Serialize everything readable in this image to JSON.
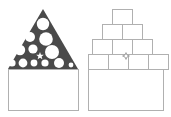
{
  "canvas": {
    "width": 171,
    "height": 117,
    "background": "#ffffff"
  },
  "palette": {
    "triangle_fill": "#4a4a4a",
    "circle_fill": "#ffffff",
    "star_fill": "#ffffff",
    "outline_stroke": "#b0b0b0",
    "box_fill": "#ffffff",
    "marker_stroke": "#9a9a9a"
  },
  "figures": [
    {
      "id": "left",
      "name": "filled-triangle-on-base",
      "description": "Dark triangle containing white circles of varying sizes above a plain rectangular base",
      "triangle": {
        "apex": [
          43,
          9
        ],
        "left_corner": [
          8,
          69
        ],
        "right_corner": [
          78,
          69
        ],
        "fill": "#4a4a4a"
      },
      "circles": [
        {
          "cx": 43,
          "cy": 24,
          "r": 6.2
        },
        {
          "cx": 30,
          "cy": 37,
          "r": 5.0
        },
        {
          "cx": 46,
          "cy": 39,
          "r": 6.8
        },
        {
          "cx": 20,
          "cy": 50,
          "r": 5.2
        },
        {
          "cx": 33,
          "cy": 49,
          "r": 4.6
        },
        {
          "cx": 52,
          "cy": 52,
          "r": 7.0
        },
        {
          "cx": 12,
          "cy": 63,
          "r": 3.6
        },
        {
          "cx": 23,
          "cy": 63,
          "r": 4.4
        },
        {
          "cx": 34,
          "cy": 63,
          "r": 3.4
        },
        {
          "cx": 45,
          "cy": 63,
          "r": 3.6
        },
        {
          "cx": 59,
          "cy": 63,
          "r": 5.0
        },
        {
          "cx": 71,
          "cy": 65,
          "r": 2.4
        }
      ],
      "star": {
        "cx": 40,
        "cy": 56,
        "r": 4.0,
        "points": 5,
        "fill": "#ffffff"
      },
      "base_rect": {
        "x": 8,
        "y": 69,
        "width": 70,
        "height": 41
      }
    },
    {
      "id": "right",
      "name": "stacked-box-pyramid-on-base",
      "description": "Outlined rectangular boxes stacked in a 1-2-3-4 pyramid above a large rectangular base",
      "rows": [
        {
          "row": 1,
          "count": 1,
          "y": 9,
          "height": 15,
          "box_width": 20,
          "start_x": 112
        },
        {
          "row": 2,
          "count": 2,
          "y": 24,
          "height": 15,
          "box_width": 20,
          "start_x": 102
        },
        {
          "row": 3,
          "count": 3,
          "y": 39,
          "height": 15,
          "box_width": 20,
          "start_x": 92
        },
        {
          "row": 4,
          "count": 4,
          "y": 54,
          "height": 15,
          "box_width": 20,
          "start_x": 88
        }
      ],
      "marker": {
        "cx": 126,
        "cy": 56,
        "r": 3.4,
        "points": 4,
        "stroke": "#9a9a9a"
      },
      "base_rect": {
        "x": 88,
        "y": 69,
        "width": 75,
        "height": 41
      }
    }
  ]
}
